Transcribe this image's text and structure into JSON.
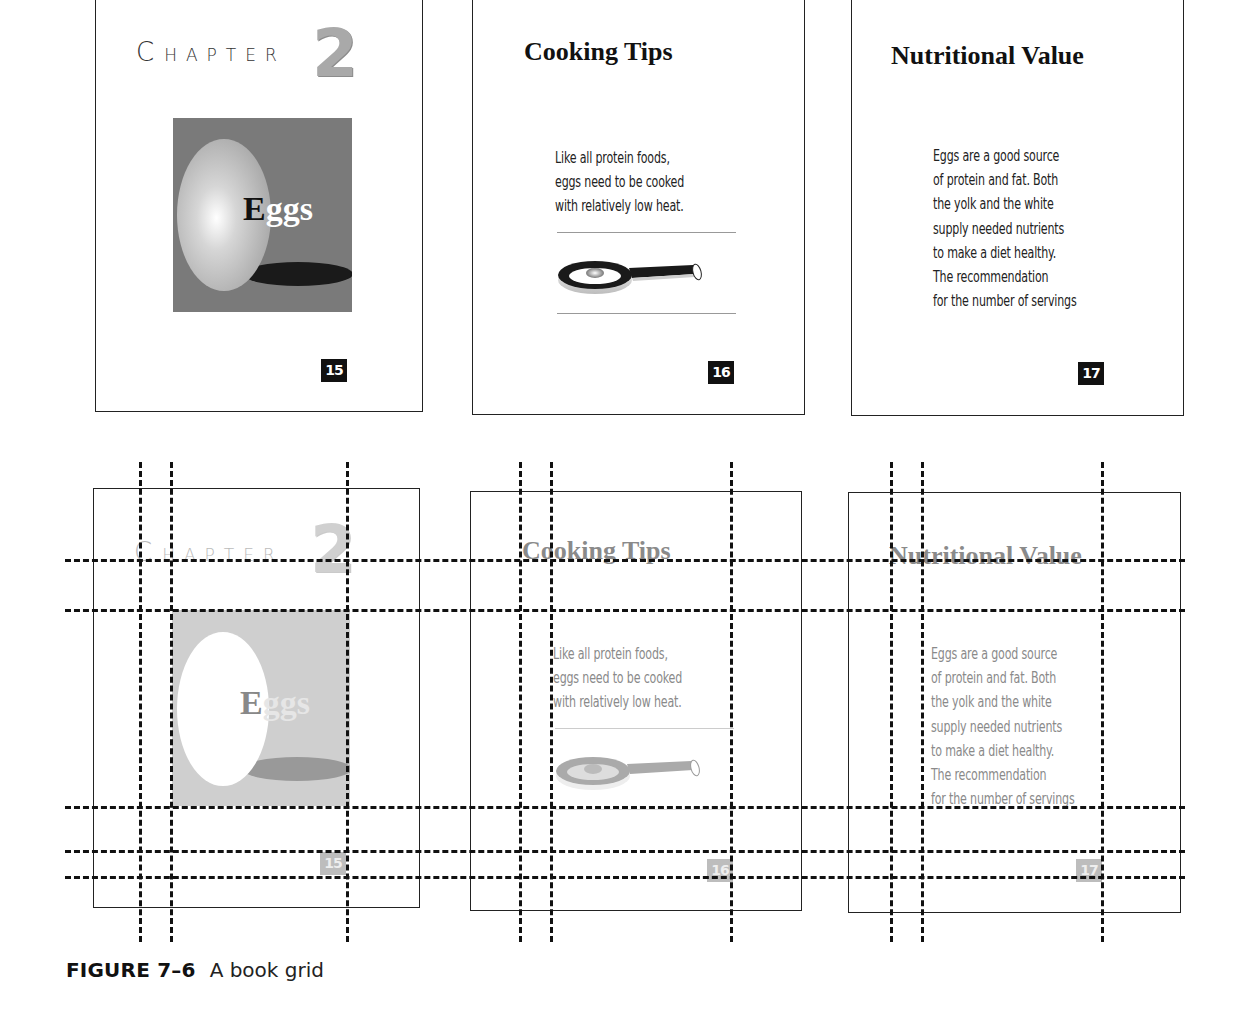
{
  "figure": {
    "label": "FIGURE 7–6",
    "caption": "A book grid"
  },
  "pages": [
    {
      "folio": "15",
      "chapter_word_first": "C",
      "chapter_word_rest": "HAPTER",
      "chapter_number": "2",
      "image_word_first": "E",
      "image_word_rest": "ggs",
      "image_description": "egg-illustration"
    },
    {
      "folio": "16",
      "title": "Cooking Tips",
      "body_lines": [
        "Like all protein foods,",
        "eggs need to be cooked",
        "with relatively low heat."
      ],
      "image_description": "frying-pan-illustration"
    },
    {
      "folio": "17",
      "title": "Nutritional Value",
      "body_lines": [
        "Eggs are a good source",
        "of protein and fat. Both",
        "the yolk and the white",
        "supply needed nutrients",
        "to make a diet healthy.",
        "The recommendation",
        "for the number of servings"
      ]
    }
  ],
  "grid": {
    "description": "Dashed grid overlay on ghosted copies of pages 15–17",
    "horizontal_guides_y": [
      560,
      610,
      807,
      851,
      877
    ],
    "vertical_guides_per_page": 3
  },
  "colors": {
    "frame": "#222222",
    "image_bg": "#7a7a7a",
    "folio_bg": "#111111",
    "chapter_number": "#a9a9a9",
    "grid_line": "#111111"
  }
}
